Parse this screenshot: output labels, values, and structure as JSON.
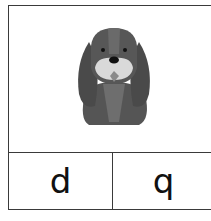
{
  "card": {
    "image": {
      "icon": "dog-icon",
      "alt": "dog"
    },
    "options": [
      {
        "label": "d"
      },
      {
        "label": "q"
      }
    ]
  }
}
